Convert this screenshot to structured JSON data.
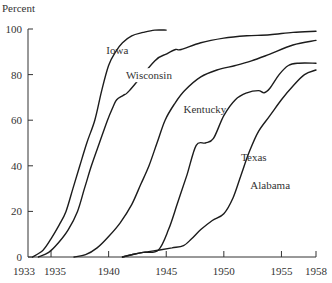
{
  "chart_data": {
    "type": "line",
    "title": "",
    "ylabel": "Percent",
    "xlabel": "",
    "xlim": [
      1933,
      1958
    ],
    "ylim": [
      0,
      100
    ],
    "grid": false,
    "legend": "inline labels",
    "x_ticks": [
      1933,
      1935,
      1940,
      1945,
      1950,
      1955,
      1958
    ],
    "y_ticks": [
      0,
      20,
      40,
      60,
      80,
      100
    ],
    "series": [
      {
        "name": "Iowa",
        "points": [
          [
            1933.4,
            0
          ],
          [
            1934.3,
            3
          ],
          [
            1935.0,
            8
          ],
          [
            1935.7,
            14
          ],
          [
            1936.3,
            20
          ],
          [
            1936.9,
            30
          ],
          [
            1937.5,
            40
          ],
          [
            1938.1,
            50
          ],
          [
            1938.8,
            60
          ],
          [
            1939.4,
            73
          ],
          [
            1940.0,
            84
          ],
          [
            1940.6,
            90
          ],
          [
            1941.2,
            94
          ],
          [
            1942.0,
            97
          ],
          [
            1943.0,
            98.5
          ],
          [
            1944.0,
            99.5
          ],
          [
            1945.0,
            99.5
          ]
        ],
        "label_pos": [
          1939.8,
          89
        ]
      },
      {
        "name": "Wisconsin",
        "points": [
          [
            1933.9,
            0
          ],
          [
            1934.8,
            2
          ],
          [
            1935.6,
            6
          ],
          [
            1936.5,
            12
          ],
          [
            1937.3,
            20
          ],
          [
            1937.9,
            30
          ],
          [
            1938.5,
            40
          ],
          [
            1939.2,
            50
          ],
          [
            1939.9,
            60
          ],
          [
            1940.4,
            66
          ],
          [
            1940.7,
            69
          ],
          [
            1941.3,
            71
          ],
          [
            1941.8,
            73
          ],
          [
            1944.0,
            86
          ],
          [
            1945.0,
            89
          ],
          [
            1945.8,
            91
          ],
          [
            1946.3,
            91
          ],
          [
            1948.0,
            94
          ],
          [
            1950.0,
            96
          ],
          [
            1952.0,
            97
          ],
          [
            1954.0,
            97.5
          ],
          [
            1956.0,
            98.5
          ],
          [
            1958.0,
            99
          ]
        ],
        "label_pos": [
          1941.5,
          78
        ]
      },
      {
        "name": "Kentucky",
        "points": [
          [
            1937.0,
            0
          ],
          [
            1938.0,
            1
          ],
          [
            1939.0,
            4
          ],
          [
            1940.0,
            9
          ],
          [
            1941.0,
            15
          ],
          [
            1942.0,
            23
          ],
          [
            1942.8,
            32
          ],
          [
            1943.5,
            40
          ],
          [
            1944.2,
            50
          ],
          [
            1944.9,
            60
          ],
          [
            1945.7,
            67
          ],
          [
            1946.6,
            73
          ],
          [
            1948.0,
            79
          ],
          [
            1949.4,
            82
          ],
          [
            1951.0,
            84
          ],
          [
            1952.4,
            86
          ],
          [
            1954.0,
            89
          ],
          [
            1956.0,
            93
          ],
          [
            1958.0,
            95
          ]
        ],
        "label_pos": [
          1946.5,
          63
        ]
      },
      {
        "name": "Texas",
        "points": [
          [
            1941.2,
            0
          ],
          [
            1942.0,
            1
          ],
          [
            1943.0,
            2
          ],
          [
            1944.3,
            3
          ],
          [
            1945.2,
            12
          ],
          [
            1946.0,
            24
          ],
          [
            1946.8,
            36
          ],
          [
            1947.6,
            49
          ],
          [
            1948.4,
            50
          ],
          [
            1949.1,
            52
          ],
          [
            1950.0,
            62
          ],
          [
            1951.0,
            69
          ],
          [
            1952.0,
            72
          ],
          [
            1953.0,
            73
          ],
          [
            1953.5,
            72
          ],
          [
            1954.0,
            74
          ],
          [
            1954.8,
            80
          ],
          [
            1955.6,
            84
          ],
          [
            1956.5,
            85
          ],
          [
            1958.0,
            85
          ]
        ],
        "label_pos": [
          1951.5,
          42
        ]
      },
      {
        "name": "Alabama",
        "points": [
          [
            1941.2,
            0
          ],
          [
            1942.0,
            1
          ],
          [
            1943.0,
            2
          ],
          [
            1944.3,
            3
          ],
          [
            1945.5,
            4
          ],
          [
            1946.5,
            5
          ],
          [
            1947.2,
            8
          ],
          [
            1948.0,
            12
          ],
          [
            1949.0,
            16
          ],
          [
            1950.0,
            19
          ],
          [
            1950.8,
            26
          ],
          [
            1951.5,
            36
          ],
          [
            1952.2,
            46
          ],
          [
            1953.0,
            55
          ],
          [
            1954.0,
            62
          ],
          [
            1955.0,
            69
          ],
          [
            1956.0,
            75
          ],
          [
            1957.0,
            80
          ],
          [
            1958.0,
            82
          ]
        ],
        "label_pos": [
          1952.3,
          30
        ]
      }
    ]
  },
  "axes": {
    "y_title": "Percent",
    "x_tick_labels": [
      "1933",
      "1935",
      "1940",
      "1945",
      "1950",
      "1955",
      "1958"
    ],
    "y_tick_labels": [
      "0",
      "20",
      "40",
      "60",
      "80",
      "100"
    ]
  }
}
